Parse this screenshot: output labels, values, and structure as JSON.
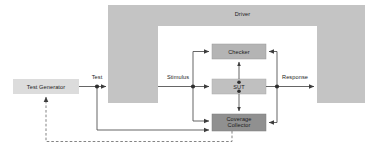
{
  "diagram": {
    "blocks": {
      "test_generator": {
        "label": "Test Generator",
        "fill": "#dcdcdc"
      },
      "driver": {
        "label": "Driver",
        "fill": "#c4c4c4"
      },
      "checker": {
        "label": "Checker",
        "fill": "#b4b4b4"
      },
      "sut": {
        "label": "SUT",
        "fill": "#c0c0c0"
      },
      "coverage_collector": {
        "label_line1": "Coverage",
        "label_line2": "Collector",
        "fill": "#909090"
      }
    },
    "signals": {
      "test": "Test",
      "stimulus": "Stimulus",
      "response": "Response"
    },
    "colors": {
      "line": "#4a4a4a",
      "dashed_feedback": "#6e6e6e",
      "text": "#1b1b1b",
      "box_border": "#8a8a8a",
      "background": "#ffffff"
    }
  }
}
